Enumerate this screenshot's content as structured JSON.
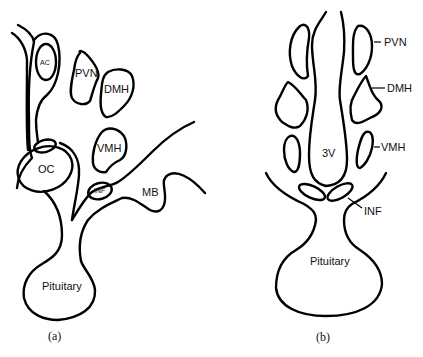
{
  "figure": {
    "panel_a": {
      "caption": "(a)",
      "labels": {
        "ac": "AC",
        "pvn": "PVN",
        "dmh": "DMH",
        "vmh": "VMH",
        "oc": "OC",
        "inf": "INF",
        "mb": "MB",
        "pituitary": "Pituitary"
      }
    },
    "panel_b": {
      "caption": "(b)",
      "labels": {
        "pvn": "PVN",
        "dmh": "DMH",
        "vmh": "VMH",
        "third_ventricle": "3V",
        "inf": "INF",
        "pituitary": "Pituitary"
      }
    }
  }
}
